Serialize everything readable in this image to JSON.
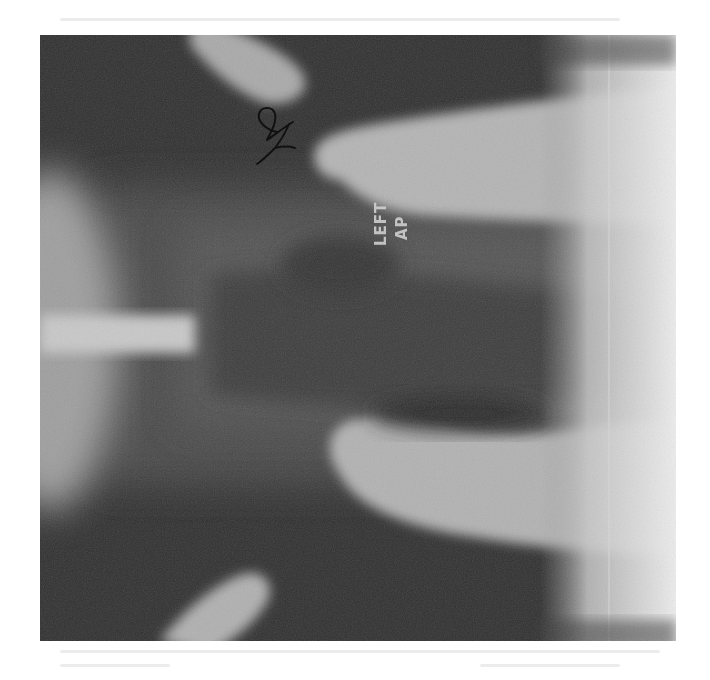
{
  "image": {
    "description": "Scanned radiograph (X-ray) of a knee joint, AP view, rotated 90 degrees, printed on a white page",
    "marker": {
      "line1": "LEFT",
      "line2": "AP"
    },
    "handwritten_mark": "handwritten initials/annotation",
    "colors": {
      "page_background": "#ffffff",
      "film_dark": "#2e2e2e",
      "bone_light": "#b8b8b8",
      "overexposed_edge": "#e6e6e6"
    }
  }
}
